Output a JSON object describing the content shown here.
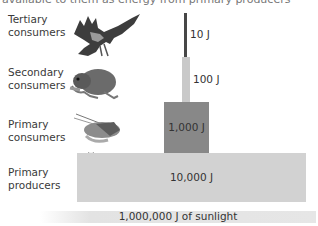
{
  "caption_fragment": "available to them as energy from primary producers",
  "levels": [
    {
      "name": "Tertiary consumers",
      "line1": "Tertiary",
      "line2": "consumers",
      "energy": "10 J",
      "organism": "hawk"
    },
    {
      "name": "Secondary consumers",
      "line1": "Secondary",
      "line2": "consumers",
      "energy": "100 J",
      "organism": "mouse"
    },
    {
      "name": "Primary consumers",
      "line1": "Primary",
      "line2": "consumers",
      "energy": "1,000 J",
      "organism": "grasshopper"
    },
    {
      "name": "Primary producers",
      "line1": "Primary",
      "line2": "producers",
      "energy": "10,000 J",
      "organism": "flower"
    }
  ],
  "base": {
    "label": "1,000,000 J of sunlight"
  },
  "colors": {
    "tertiary_bar": "#474747",
    "secondary_bar": "#c9c9c9",
    "primary_consumer_bar": "#888888",
    "producer_bar": "#d2d2d2",
    "sunlight_bar": "#e4e4e4"
  }
}
